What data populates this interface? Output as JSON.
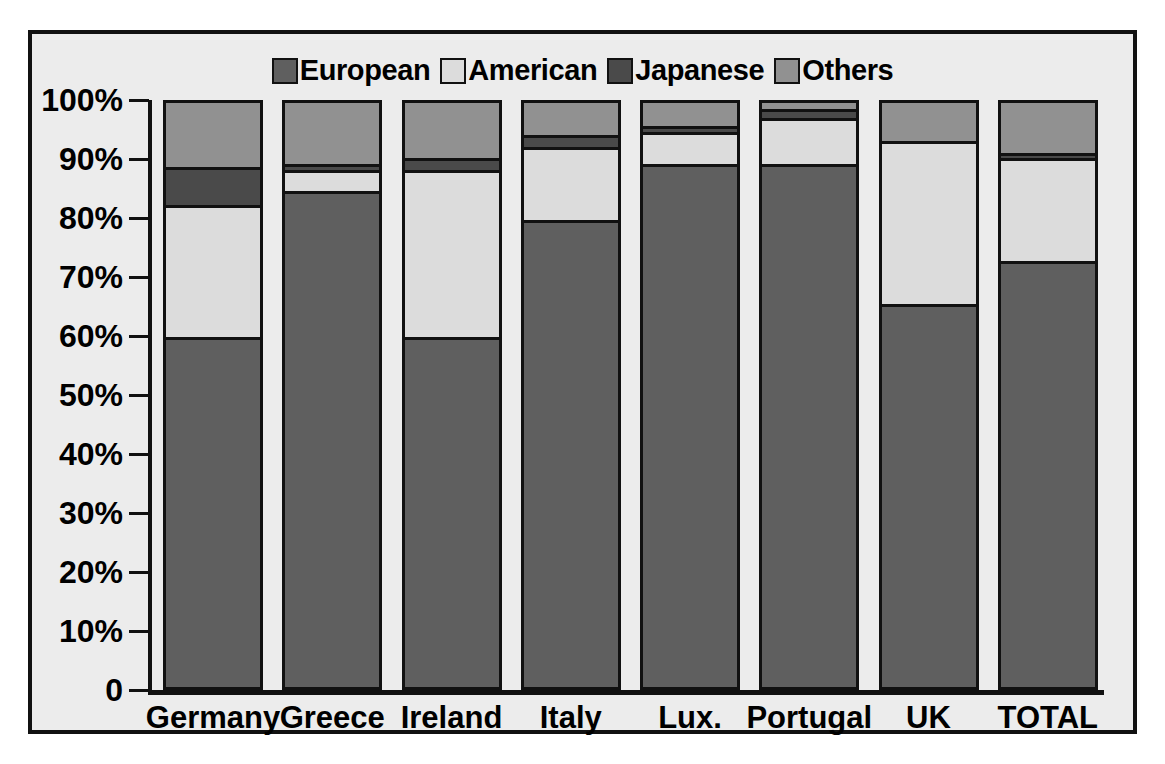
{
  "chart_data": {
    "type": "bar",
    "subtype": "stacked-percentage",
    "title": "",
    "subtitle": "",
    "xlabel": "",
    "ylabel": "",
    "ylim": [
      0,
      100
    ],
    "grid": false,
    "legend_position": "top-right",
    "categories": [
      "Germany",
      "Greece",
      "Ireland",
      "Italy",
      "Lux.",
      "Portugal",
      "UK",
      "TOTAL"
    ],
    "ytick_labels": [
      "0",
      "10%",
      "20%",
      "30%",
      "40%",
      "50%",
      "60%",
      "70%",
      "80%",
      "90%",
      "100%"
    ],
    "ytick_values": [
      0,
      10,
      20,
      30,
      40,
      50,
      60,
      70,
      80,
      90,
      100
    ],
    "series": [
      {
        "name": "European",
        "color": "#5f5f5f",
        "values": [
          59.5,
          84.5,
          59.5,
          79.5,
          89.0,
          89.0,
          65.0,
          72.5
        ]
      },
      {
        "name": "American",
        "color": "#dcdcdc",
        "values": [
          22.5,
          3.5,
          28.5,
          12.5,
          5.5,
          8.0,
          28.0,
          17.5
        ]
      },
      {
        "name": "Japanese",
        "color": "#4a4a4a",
        "values": [
          6.5,
          1.0,
          2.0,
          2.0,
          1.0,
          1.5,
          0.0,
          1.0
        ]
      },
      {
        "name": "Others",
        "color": "#919191",
        "values": [
          11.5,
          11.0,
          10.0,
          6.0,
          4.5,
          1.5,
          7.0,
          9.0
        ]
      }
    ]
  },
  "legend": {
    "items": [
      {
        "label": "European",
        "color": "#5f5f5f"
      },
      {
        "label": "American",
        "color": "#dcdcdc"
      },
      {
        "label": "Japanese",
        "color": "#4a4a4a"
      },
      {
        "label": "Others",
        "color": "#919191"
      }
    ]
  },
  "colors": {
    "frame": "#111111",
    "background": "#ececec",
    "european": "#5f5f5f",
    "american": "#dcdcdc",
    "japanese": "#4a4a4a",
    "others": "#919191"
  }
}
